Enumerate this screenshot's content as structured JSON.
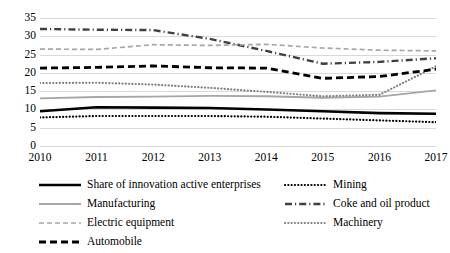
{
  "chart_data": {
    "type": "line",
    "title": "",
    "subtitle": "",
    "xlabel": "",
    "ylabel": "",
    "x": [
      2010,
      2011,
      2012,
      2013,
      2014,
      2015,
      2016,
      2017
    ],
    "categories": [
      "2010",
      "2011",
      "2012",
      "2013",
      "2014",
      "2015",
      "2016",
      "2017"
    ],
    "ylim": [
      0,
      35
    ],
    "yticks": [
      0,
      5,
      10,
      15,
      20,
      25,
      30,
      35
    ],
    "ytick_labels": [
      "0",
      "5",
      "10",
      "15",
      "20",
      "25",
      "30",
      "35"
    ],
    "grid": true,
    "legend_position": "bottom",
    "series": [
      {
        "name": "Share of innovation active enterprises",
        "style": "solid-thick",
        "color": "#000000",
        "values": [
          9.5,
          10.6,
          10.5,
          10.4,
          10.0,
          9.5,
          9.0,
          8.8
        ]
      },
      {
        "name": "Mining",
        "style": "dotted",
        "color": "#000000",
        "values": [
          7.8,
          8.2,
          8.2,
          8.2,
          8.0,
          7.5,
          7.0,
          6.5
        ]
      },
      {
        "name": "Manufacturing",
        "style": "solid",
        "color": "#a6a6a6",
        "values": [
          13.0,
          13.4,
          13.5,
          13.7,
          13.6,
          13.2,
          13.5,
          15.2
        ]
      },
      {
        "name": "Coke and oil product",
        "style": "dash-dot",
        "color": "#404040",
        "values": [
          32.0,
          31.8,
          31.7,
          29.3,
          26.0,
          22.5,
          23.0,
          24.0
        ]
      },
      {
        "name": "Electric equipment",
        "style": "dashed",
        "color": "#a6a6a6",
        "values": [
          26.5,
          26.4,
          27.7,
          27.5,
          27.8,
          26.8,
          26.2,
          26.0
        ]
      },
      {
        "name": "Machinery",
        "style": "dotted",
        "color": "#808080",
        "values": [
          17.2,
          17.3,
          16.8,
          15.9,
          14.8,
          13.6,
          14.0,
          21.8
        ]
      },
      {
        "name": "Automobile",
        "style": "dashed-thick",
        "color": "#000000",
        "values": [
          21.3,
          21.5,
          21.9,
          21.4,
          21.3,
          18.5,
          19.0,
          21.0
        ]
      }
    ]
  },
  "legend": {
    "items": [
      {
        "label": "Share of innovation active enterprises",
        "series": 0
      },
      {
        "label": "Mining",
        "series": 1
      },
      {
        "label": "Manufacturing",
        "series": 2
      },
      {
        "label": "Coke and oil product",
        "series": 3
      },
      {
        "label": "Electric equipment",
        "series": 4
      },
      {
        "label": "Machinery",
        "series": 5
      },
      {
        "label": "Automobile",
        "series": 6
      }
    ]
  },
  "colors": {
    "gridline": "#d9d9d9",
    "background": "#ffffff",
    "text": "#000000"
  }
}
